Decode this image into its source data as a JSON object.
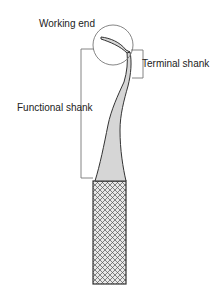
{
  "diagram": {
    "labels": {
      "working_end": "Working end",
      "terminal_shank": "Terminal shank",
      "functional_shank": "Functional shank"
    },
    "colors": {
      "shank_fill": "#d6d6d6",
      "outline": "#333333",
      "leader": "#777777",
      "text": "#222222"
    }
  }
}
